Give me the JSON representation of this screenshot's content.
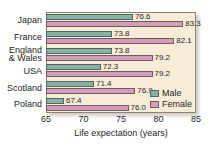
{
  "chart_data": {
    "type": "bar",
    "orientation": "horizontal",
    "title": "",
    "xlabel": "Life expectation (years)",
    "ylabel": "",
    "xlim": [
      65,
      85
    ],
    "xticks": [
      65,
      70,
      75,
      80,
      85
    ],
    "grid": false,
    "legend_position": "bottom-right",
    "categories": [
      "Japan",
      "France",
      "England\n& Wales",
      "USA",
      "Scotland",
      "Poland"
    ],
    "category_lines": [
      [
        "Japan"
      ],
      [
        "France"
      ],
      [
        "England",
        "& Wales"
      ],
      [
        "USA"
      ],
      [
        "Scotland"
      ],
      [
        "Poland"
      ]
    ],
    "series": [
      {
        "name": "Male",
        "color": "#8ab0a4",
        "values": [
          76.6,
          73.8,
          73.8,
          72.3,
          71.4,
          67.4
        ],
        "value_labels": [
          "76.6",
          "73.8",
          "73.8",
          "72.3",
          "71.4",
          "67.4"
        ]
      },
      {
        "name": "Female",
        "color": "#cf9fb6",
        "values": [
          83.3,
          82.1,
          79.2,
          79.2,
          76.9,
          76.0
        ],
        "value_labels": [
          "83.3",
          "82.1",
          "79.2",
          "79.2",
          "76.9",
          "76.0"
        ]
      }
    ]
  },
  "legend": {
    "items": [
      {
        "label": "Male",
        "color": "#8ab0a4"
      },
      {
        "label": "Female",
        "color": "#cf9fb6"
      }
    ]
  },
  "axis": {
    "x_title": "Life expectation (years)",
    "x_tick_labels": [
      "65",
      "70",
      "75",
      "80",
      "85"
    ]
  },
  "colors": {
    "male": "#8ab0a4",
    "female": "#cf9fb6",
    "plot_background": "#f7ecd7",
    "page_background": "#ffffff",
    "frame_border": "#8d8374",
    "text": "#262626"
  }
}
